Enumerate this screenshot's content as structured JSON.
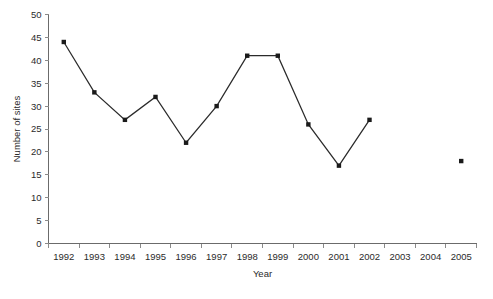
{
  "chart_data": {
    "type": "line",
    "title": "",
    "xlabel": "Year",
    "ylabel": "Number of sites",
    "categories": [
      "1992",
      "1993",
      "1994",
      "1995",
      "1996",
      "1997",
      "1998",
      "1999",
      "2000",
      "2001",
      "2002",
      "2003",
      "2004",
      "2005"
    ],
    "values": [
      44,
      33,
      27,
      32,
      22,
      30,
      41,
      41,
      26,
      17,
      27,
      null,
      null,
      18
    ],
    "series": [
      {
        "name": "Number of sites",
        "values": [
          44,
          33,
          27,
          32,
          22,
          30,
          41,
          41,
          26,
          17,
          27,
          null,
          null,
          18
        ]
      }
    ],
    "ylim": [
      0,
      50
    ],
    "y_ticks": [
      0,
      5,
      10,
      15,
      20,
      25,
      30,
      35,
      40,
      45,
      50
    ],
    "y_tick_labels": [
      "0",
      "5",
      "10",
      "15",
      "20",
      "25",
      "30",
      "35",
      "40",
      "45",
      "50"
    ],
    "x_tick_labels": [
      "1992",
      "1993",
      "1994",
      "1995",
      "1996",
      "1997",
      "1998",
      "1999",
      "2000",
      "2001",
      "2002",
      "2003",
      "2004",
      "2005"
    ],
    "grid": false,
    "legend": false,
    "legend_position": "none",
    "marker": "square",
    "line_color": "#2b2b2b",
    "marker_color": "#1a1a1a",
    "axis_color": "#6b6b6b",
    "text_color": "#2b2b2b",
    "background_color": "#ffffff",
    "annotations": [
      "2003 and 2004 have no data points",
      "2005 point is not connected to the line"
    ]
  },
  "axes": {
    "y_title": "Number of sites",
    "x_title": "Year"
  }
}
